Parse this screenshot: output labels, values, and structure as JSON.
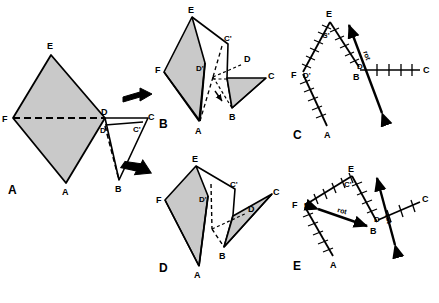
{
  "figure": {
    "width": 439,
    "height": 303,
    "background": "#ffffff",
    "stroke_color": "#000000",
    "shaded_fill": "#c9c9c9",
    "unshaded_fill": "#ffffff"
  },
  "panels": [
    {
      "id": "A",
      "label": "A",
      "caption": "Flat unfolded figure: shaded rhombus F-E-D-A with attached triangle D-C-B and dashed fold lines",
      "vertices": [
        {
          "name": "E",
          "label": "E"
        },
        {
          "name": "F",
          "label": "F"
        },
        {
          "name": "D",
          "label": "D"
        },
        {
          "name": "Dprime",
          "label": "D'"
        },
        {
          "name": "C",
          "label": "C"
        },
        {
          "name": "Cprime",
          "label": "C'"
        },
        {
          "name": "A",
          "label": "A"
        },
        {
          "name": "B",
          "label": "B"
        }
      ]
    },
    {
      "id": "B",
      "label": "B",
      "caption": "First folded 3D view: shaded panels F-E-A and D-B-C with dashed hidden edges",
      "vertices": [
        {
          "name": "E",
          "label": "E"
        },
        {
          "name": "F",
          "label": "F"
        },
        {
          "name": "Dprime",
          "label": "D'"
        },
        {
          "name": "Cprime",
          "label": "C'"
        },
        {
          "name": "D",
          "label": "D"
        },
        {
          "name": "C",
          "label": "C"
        },
        {
          "name": "A",
          "label": "A"
        },
        {
          "name": "B",
          "label": "B"
        }
      ]
    },
    {
      "id": "C",
      "label": "C",
      "caption": "Edge-on schematic of panel B with hatched (tick-marked) edges and rotation axis arrow",
      "annotation": "rot",
      "vertices": [
        {
          "name": "E",
          "label": "E"
        },
        {
          "name": "Cprime",
          "label": "C'"
        },
        {
          "name": "F",
          "label": "F"
        },
        {
          "name": "Dprime",
          "label": "D'"
        },
        {
          "name": "D",
          "label": "D"
        },
        {
          "name": "B",
          "label": "B"
        },
        {
          "name": "C",
          "label": "C"
        },
        {
          "name": "A",
          "label": "A"
        }
      ]
    },
    {
      "id": "D",
      "label": "D",
      "caption": "Second folded 3D view: alternate fold with shaded panels F-E-A and D-B-C",
      "vertices": [
        {
          "name": "E",
          "label": "E"
        },
        {
          "name": "F",
          "label": "F"
        },
        {
          "name": "Dprime",
          "label": "D'"
        },
        {
          "name": "Cprime",
          "label": "C'"
        },
        {
          "name": "D",
          "label": "D"
        },
        {
          "name": "C",
          "label": "C"
        },
        {
          "name": "A",
          "label": "A"
        },
        {
          "name": "B",
          "label": "B"
        }
      ]
    },
    {
      "id": "E",
      "label": "E",
      "caption": "Edge-on schematic of panel D with hatched edges, rotation axis arrow and rot direction arrow",
      "annotation": "rot",
      "annotation2": "rot",
      "vertices": [
        {
          "name": "E",
          "label": "E"
        },
        {
          "name": "Cprime",
          "label": "C'"
        },
        {
          "name": "F",
          "label": "F"
        },
        {
          "name": "Dprime",
          "label": "D'"
        },
        {
          "name": "D",
          "label": "D"
        },
        {
          "name": "B",
          "label": "B"
        },
        {
          "name": "C",
          "label": "C"
        },
        {
          "name": "A",
          "label": "A"
        }
      ]
    }
  ],
  "flow_arrows": [
    {
      "name": "arrow-a-to-b",
      "direction": "right",
      "from": "A",
      "to": "B"
    },
    {
      "name": "arrow-a-to-d",
      "direction": "down-right",
      "from": "A",
      "to": "D"
    }
  ]
}
